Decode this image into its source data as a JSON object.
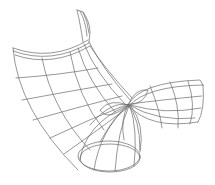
{
  "figure": {
    "background": "#ffffff",
    "stroke_color": "#6a6a6a",
    "stroke_width": 0.7,
    "label": ""
  }
}
